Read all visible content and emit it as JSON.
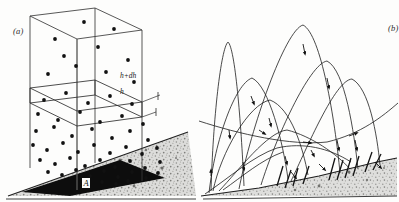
{
  "figure": {
    "background_color": "#fdfdfc",
    "ink_color": "#1a1a1a",
    "panels": [
      {
        "id": "a",
        "label": "(a)",
        "title": "column over sloping sand bed",
        "annotations": [
          {
            "name": "height-upper",
            "text": "h+dh"
          },
          {
            "name": "height-lower",
            "text": "h"
          },
          {
            "name": "base-area",
            "text": "A"
          }
        ],
        "ground": {
          "fill_color": "#d8d8d6",
          "texture": "stipple",
          "dark_base_color": "#0d0d0d",
          "slope_description": "rising to the right"
        },
        "box": {
          "edge_color": "#2a2a2a",
          "slab_between": [
            "h",
            "h+dh"
          ]
        },
        "grains": {
          "color": "#111111",
          "count": 58,
          "density_note": "increases toward the bed"
        }
      },
      {
        "id": "b",
        "label": "(b)",
        "title": "saltation trajectories over sand surface",
        "ground": {
          "fill_color": "#d9d9d7",
          "texture": "stipple",
          "slope_description": "rising to the right"
        },
        "trajectories": {
          "stroke_color": "#1a1a1a",
          "arrowhead_color": "#111111",
          "count": 17
        }
      }
    ]
  },
  "chart_data": {
    "type": "scatter",
    "title": "",
    "xlabel": "",
    "ylabel": "",
    "panel_a": {
      "description": "Vertical column of unit cross-section A standing on an inclined sand bed; a thin horizontal slab is isolated between heights h and h+dh. Dots represent saltating grains, whose concentration increases downward toward the bed.",
      "heights": [
        "h",
        "h+dh"
      ],
      "base_area_label": "A",
      "box_corners_2d": [
        [
          30,
          16
        ],
        [
          95,
          8
        ],
        [
          142,
          30
        ],
        [
          142,
          150
        ],
        [
          95,
          163
        ],
        [
          30,
          160
        ]
      ],
      "slab_top_y": 81,
      "slab_bottom_y": 96,
      "grain_points": [
        [
          55,
          39
        ],
        [
          84,
          22
        ],
        [
          114,
          29
        ],
        [
          64,
          56
        ],
        [
          98,
          47
        ],
        [
          128,
          60
        ],
        [
          48,
          74
        ],
        [
          76,
          66
        ],
        [
          106,
          72
        ],
        [
          134,
          82
        ],
        [
          44,
          100
        ],
        [
          66,
          93
        ],
        [
          88,
          103
        ],
        [
          110,
          96
        ],
        [
          132,
          104
        ],
        [
          38,
          114
        ],
        [
          58,
          120
        ],
        [
          80,
          112
        ],
        [
          100,
          122
        ],
        [
          122,
          116
        ],
        [
          143,
          124
        ],
        [
          36,
          131
        ],
        [
          54,
          127
        ],
        [
          72,
          136
        ],
        [
          92,
          129
        ],
        [
          112,
          138
        ],
        [
          130,
          131
        ],
        [
          148,
          140
        ],
        [
          33,
          145
        ],
        [
          47,
          150
        ],
        [
          63,
          143
        ],
        [
          78,
          152
        ],
        [
          94,
          145
        ],
        [
          110,
          153
        ],
        [
          126,
          147
        ],
        [
          142,
          154
        ],
        [
          157,
          148
        ],
        [
          40,
          160
        ],
        [
          55,
          164
        ],
        [
          70,
          158
        ],
        [
          85,
          166
        ],
        [
          100,
          160
        ],
        [
          115,
          167
        ],
        [
          130,
          161
        ],
        [
          145,
          168
        ],
        [
          160,
          162
        ],
        [
          48,
          172
        ],
        [
          62,
          175
        ],
        [
          76,
          170
        ],
        [
          90,
          176
        ],
        [
          104,
          171
        ],
        [
          118,
          177
        ],
        [
          132,
          172
        ],
        [
          146,
          178
        ],
        [
          158,
          173
        ],
        [
          88,
          183
        ],
        [
          102,
          182
        ],
        [
          116,
          184
        ],
        [
          128,
          181
        ]
      ]
    },
    "panel_b": {
      "description": "Family of saltation trajectories: grains leap from the bed on steep ascending limbs, arc over in long parabolas, and descend at shallow angles to impact the sand surface, ejecting further grains. Arrowheads mark the direction of motion.",
      "surface_points": [
        [
          2,
          196
        ],
        [
          60,
          188
        ],
        [
          120,
          176
        ],
        [
          175,
          163
        ],
        [
          200,
          158
        ]
      ],
      "trajectories": [
        {
          "name": "hop-1",
          "start": [
            12,
            190
          ],
          "apex": [
            28,
            42
          ],
          "end": [
            45,
            186
          ],
          "apex_height": 148
        },
        {
          "name": "hop-2",
          "start": [
            10,
            192
          ],
          "apex": [
            52,
            78
          ],
          "end": [
            88,
            178
          ],
          "apex_height": 114
        },
        {
          "name": "hop-3",
          "start": [
            14,
            190
          ],
          "apex": [
            70,
            100
          ],
          "end": [
            108,
            174
          ],
          "apex_height": 90
        },
        {
          "name": "hop-4",
          "start": [
            40,
            188
          ],
          "apex": [
            104,
            24
          ],
          "end": [
            140,
            172
          ],
          "apex_height": 164
        },
        {
          "name": "hop-5",
          "start": [
            62,
            184
          ],
          "apex": [
            128,
            60
          ],
          "end": [
            158,
            168
          ],
          "apex_height": 124
        },
        {
          "name": "hop-6",
          "start": [
            92,
            180
          ],
          "apex": [
            152,
            78
          ],
          "end": [
            180,
            164
          ],
          "apex_height": 102
        },
        {
          "name": "hop-7",
          "start": [
            20,
            190
          ],
          "apex": [
            86,
            130
          ],
          "end": [
            150,
            168
          ],
          "apex_height": 60
        },
        {
          "name": "low-skim",
          "start": [
            0,
            122
          ],
          "apex": [
            120,
            140
          ],
          "end": [
            196,
            104
          ],
          "apex_height": 30
        }
      ]
    }
  }
}
